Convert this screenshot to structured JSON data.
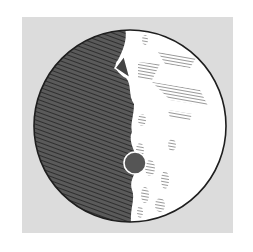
{
  "image": {
    "subject": "engraving-of-moon-half-illuminated",
    "colors": {
      "background": "#ffffff",
      "plate": "#dcdcdc",
      "shadow": "#4a4a4a",
      "lit": "#ffffff",
      "ink": "#1e1e1e"
    }
  }
}
